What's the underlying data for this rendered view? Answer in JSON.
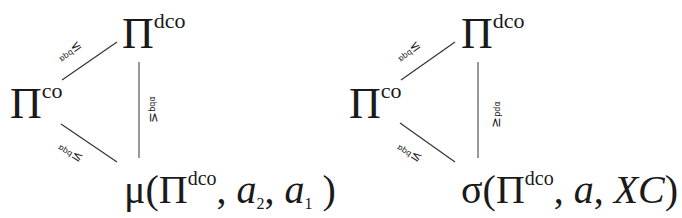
{
  "diagrams": [
    {
      "id": "left",
      "nodes": {
        "top": {
          "base": "Π",
          "sup": "dco"
        },
        "left": {
          "base": "Π",
          "sup": "co"
        },
        "bottom": {
          "prefix": "μ(",
          "base": "Π",
          "sup": "dco",
          "args": ", ",
          "arg1": "a",
          "arg1_sub": "2",
          "sep": ", ",
          "arg2": "a",
          "arg2_sub": "1",
          "suffix": " )"
        }
      },
      "edge_labels": {
        "left_top": {
          "rel": "≥",
          "sup": "α",
          "sub": "pd"
        },
        "left_bottom": {
          "rel": "≥",
          "sup": "α",
          "sub": "pd"
        },
        "top_bottom": {
          "rel": "≥",
          "sup": "α",
          "sub": "pd"
        }
      }
    },
    {
      "id": "right",
      "nodes": {
        "top": {
          "base": "Π",
          "sup": "dco"
        },
        "left": {
          "base": "Π",
          "sup": "co"
        },
        "bottom": {
          "prefix": "σ(",
          "base": "Π",
          "sup": "dco",
          "args": ", ",
          "arg1": "a",
          "sep": ", ",
          "arg2": "XC",
          "suffix": ")"
        }
      },
      "edge_labels": {
        "left_top": {
          "rel": "≥",
          "sup": "α",
          "sub": "pd"
        },
        "left_bottom": {
          "rel": "≥",
          "sup": "α",
          "sub": "pd"
        },
        "top_bottom": {
          "rel": "≥",
          "sup": "α",
          "sub": "pd"
        }
      }
    }
  ],
  "colors": {
    "line": "#333333",
    "text": "#1a1a1a",
    "background": "#ffffff"
  }
}
